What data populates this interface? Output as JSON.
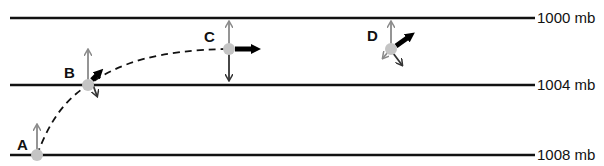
{
  "diagram": {
    "type": "geostrophic-wind-force-balance",
    "isobars": [
      {
        "label": "1000 mb",
        "y": 18
      },
      {
        "label": "1004 mb",
        "y": 85
      },
      {
        "label": "1008 mb",
        "y": 155
      }
    ],
    "points": [
      {
        "label": "A",
        "x": 37,
        "y": 155,
        "description": "parcel at rest; pressure gradient force only"
      },
      {
        "label": "B",
        "x": 88,
        "y": 85,
        "description": "PGF, Coriolis and velocity vectors"
      },
      {
        "label": "C",
        "x": 229,
        "y": 49,
        "description": "geostrophic balance; PGF opposed by Coriolis, flow parallel to isobars"
      },
      {
        "label": "D",
        "x": 391,
        "y": 49,
        "description": "PGF, Coriolis and velocity vectors"
      }
    ],
    "colors": {
      "isobar": "#111111",
      "pgf_arrow": "#8a8a8a",
      "coriolis_arrow": "#333333",
      "velocity_arrow": "#000000",
      "parcel": "#c4c4c4",
      "trajectory": "#111111"
    }
  }
}
